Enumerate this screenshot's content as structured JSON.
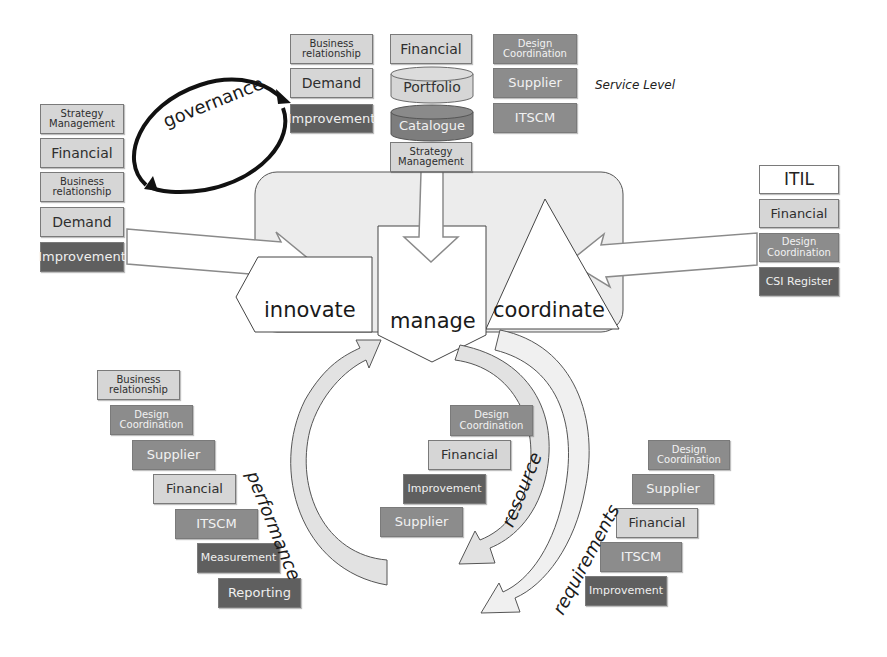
{
  "top_group_left": [
    "Business relationship",
    "Demand",
    "Improvement"
  ],
  "top_group_center": {
    "financial": "Financial",
    "portfolio": "Portfolio",
    "catalogue": "Catalogue",
    "strategy": "Strategy Management"
  },
  "top_group_right": [
    "Design Coordination",
    "Supplier",
    "ITSCM"
  ],
  "service_level": "Service Level",
  "governance": "governance",
  "left_stack": [
    "Strategy Management",
    "Financial",
    "Business relationship",
    "Demand",
    "Improvement"
  ],
  "right_stack": [
    "ITIL",
    "Financial",
    "Design Coordination",
    "CSI Register"
  ],
  "center": {
    "innovate": "innovate",
    "manage": "manage",
    "coordinate": "coordinate"
  },
  "performance": {
    "label": "performance",
    "items": [
      "Business relationship",
      "Design Coordination",
      "Supplier",
      "Financial",
      "ITSCM",
      "Measurement",
      "Reporting"
    ]
  },
  "resource": {
    "label": "resource",
    "items": [
      "Design Coordination",
      "Financial",
      "Improvement",
      "Supplier"
    ]
  },
  "requirements": {
    "label": "requirements",
    "items": [
      "Design Coordination",
      "Supplier",
      "Financial",
      "ITSCM",
      "Improvement"
    ]
  },
  "colors": {
    "light": "#d6d6d6",
    "mid": "#8c8c8c",
    "dark": "#5f5f5f",
    "panel": "#ececec"
  }
}
